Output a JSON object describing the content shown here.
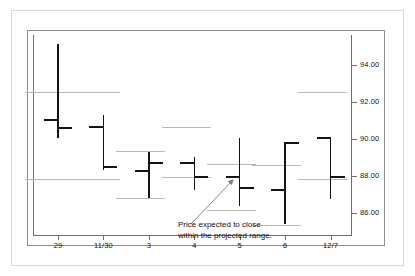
{
  "chart_data": {
    "type": "ohlc",
    "title": "",
    "xlabel": "",
    "ylabel": "",
    "ylim": [
      84.8,
      95.6
    ],
    "yticks": [
      94.0,
      92.0,
      90.0,
      88.0,
      86.0
    ],
    "ytick_labels": [
      "94.00",
      "92.00",
      "90.00",
      "88.00",
      "86.00"
    ],
    "categories": [
      "29",
      "11/30",
      "3",
      "4",
      "5",
      "6",
      "12/7"
    ],
    "grid": false,
    "legend": null,
    "series": [
      {
        "name": "OHLC bars",
        "bars": [
          {
            "x": "29",
            "high": 95.1,
            "low": 90.05,
            "open": 91.0,
            "close": 90.6
          },
          {
            "x": "11/30",
            "high": 91.3,
            "low": 88.3,
            "open": 90.65,
            "close": 88.45
          },
          {
            "x": "3",
            "high": 89.3,
            "low": 86.8,
            "open": 88.25,
            "close": 88.7
          },
          {
            "x": "4",
            "high": 89.0,
            "low": 87.2,
            "open": 88.7,
            "close": 87.95
          },
          {
            "x": "5",
            "high": 90.05,
            "low": 86.35,
            "open": 87.95,
            "close": 87.35
          },
          {
            "x": "6",
            "high": 89.8,
            "low": 85.4,
            "open": 87.25,
            "close": 89.75
          },
          {
            "x": "12/7",
            "high": 90.1,
            "low": 86.75,
            "open": 90.05,
            "close": 87.95
          }
        ]
      },
      {
        "name": "Projected range lines",
        "lines": [
          {
            "value": 92.55,
            "from": "29-left",
            "to": "29-right"
          },
          {
            "value": 87.8,
            "from": "29-left",
            "to": "29-right"
          },
          {
            "value": 92.55,
            "from": "11/30-left",
            "to": "11/30-right"
          },
          {
            "value": 87.85,
            "from": "11/30-left",
            "to": "11/30-right"
          },
          {
            "value": 89.35,
            "from": "3-left",
            "to": "3-right"
          },
          {
            "value": 86.8,
            "from": "3-left",
            "to": "3-right"
          },
          {
            "value": 90.65,
            "from": "4-left",
            "to": "4-right"
          },
          {
            "value": 87.95,
            "from": "4-left",
            "to": "4-right"
          },
          {
            "value": 88.65,
            "from": "5-left",
            "to": "5-right"
          },
          {
            "value": 86.15,
            "from": "5-left",
            "to": "5-right"
          },
          {
            "value": 88.6,
            "from": "6-left",
            "to": "6-right"
          },
          {
            "value": 85.35,
            "from": "6-left",
            "to": "6-right"
          },
          {
            "value": 92.55,
            "from": "12/7-left",
            "to": "12/7-right"
          },
          {
            "value": 87.8,
            "from": "12/7-left",
            "to": "12/7-right"
          }
        ]
      }
    ],
    "annotations": [
      {
        "id": "projected-range-note",
        "line1": "Price expected to close",
        "line2": "within the projected range.",
        "points_to": "5"
      }
    ]
  },
  "axis": {
    "y_labels": [
      "94.00",
      "92.00",
      "90.00",
      "88.00",
      "86.00"
    ],
    "x_labels": [
      "29",
      "11/30",
      "3",
      "4",
      "5",
      "6",
      "12/7"
    ]
  },
  "annotation": {
    "line1": "Price expected to close",
    "line2": "within the projected range."
  },
  "colors": {
    "bar": "#141414",
    "projection": "#b8b8b8",
    "axis": "#6f6f6f",
    "frame": "#8e8e8e",
    "outer_frame": "#d7d7d7",
    "background": "#ffffff"
  }
}
